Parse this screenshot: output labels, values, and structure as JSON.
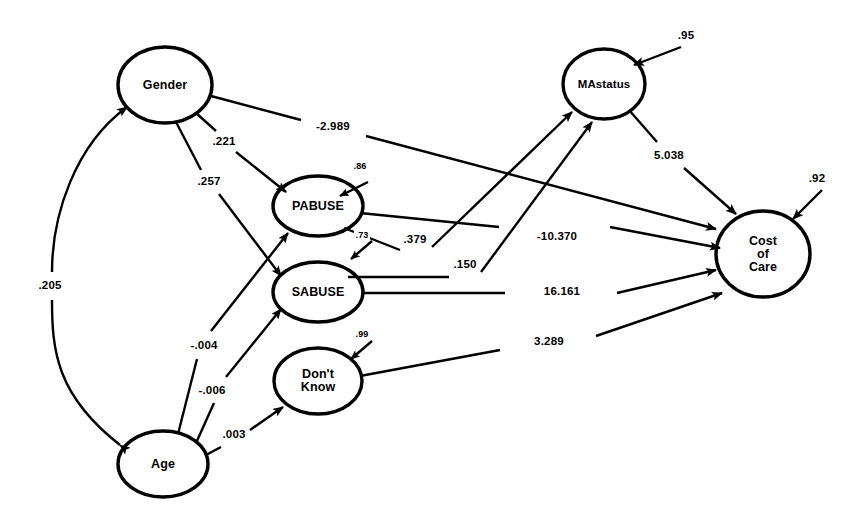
{
  "diagram": {
    "type": "path-analysis-structural-equation-model",
    "nodes": [
      {
        "id": "gender",
        "label": "Gender",
        "cx": 165,
        "cy": 85,
        "rx": 47,
        "ry": 38
      },
      {
        "id": "pabuse",
        "label": "PABUSE",
        "cx": 318,
        "cy": 206,
        "rx": 45,
        "ry": 30
      },
      {
        "id": "sabuse",
        "label": "SABUSE",
        "cx": 318,
        "cy": 292,
        "rx": 45,
        "ry": 30
      },
      {
        "id": "dontknow",
        "label": "Don't\nKnow",
        "cx": 318,
        "cy": 381,
        "rx": 44,
        "ry": 33
      },
      {
        "id": "age",
        "label": "Age",
        "cx": 163,
        "cy": 464,
        "rx": 45,
        "ry": 33
      },
      {
        "id": "mastatus",
        "label": "MAstatus",
        "cx": 604,
        "cy": 84,
        "rx": 41,
        "ry": 35
      },
      {
        "id": "cost",
        "label": "Cost\nof\nCare",
        "cx": 763,
        "cy": 254,
        "rx": 47,
        "ry": 43
      }
    ],
    "disturbances": [
      {
        "id": "e-pabuse",
        "value": ".86",
        "lx": 360,
        "ly": 166
      },
      {
        "id": "e-sabuse",
        "value": ".73",
        "lx": 362,
        "ly": 235
      },
      {
        "id": "e-dontknow",
        "value": ".99",
        "lx": 362,
        "ly": 334
      },
      {
        "id": "e-mastatus",
        "value": ".95",
        "lx": 686,
        "ly": 35
      },
      {
        "id": "e-cost",
        "value": ".92",
        "lx": 817,
        "ly": 178
      }
    ],
    "paths": [
      {
        "id": "gender-to-pabuse",
        "from": "Gender",
        "to": "PABUSE",
        "value": ".221",
        "lx": 224,
        "ly": 141
      },
      {
        "id": "gender-to-sabuse",
        "from": "Gender",
        "to": "SABUSE",
        "value": ".257",
        "lx": 209,
        "ly": 181
      },
      {
        "id": "gender-to-cost",
        "from": "Gender",
        "to": "Cost of Care",
        "value": "-2.989",
        "lx": 333,
        "ly": 126
      },
      {
        "id": "age-to-pabuse",
        "from": "Age",
        "to": "PABUSE",
        "value": "-.004",
        "lx": 204,
        "ly": 345
      },
      {
        "id": "age-to-sabuse",
        "from": "Age",
        "to": "SABUSE",
        "value": "-.006",
        "lx": 212,
        "ly": 390
      },
      {
        "id": "age-to-dontknow",
        "from": "Age",
        "to": "Don't Know",
        "value": ".003",
        "lx": 234,
        "ly": 434
      },
      {
        "id": "pabuse-to-mastatus",
        "from": "PABUSE",
        "to": "MAstatus",
        "value": ".379",
        "lx": 415,
        "ly": 239
      },
      {
        "id": "sabuse-to-mastatus",
        "from": "SABUSE",
        "to": "MAstatus",
        "value": ".150",
        "lx": 465,
        "ly": 264
      },
      {
        "id": "mastatus-to-cost",
        "from": "MAstatus",
        "to": "Cost of Care",
        "value": "5.038",
        "lx": 669,
        "ly": 155
      },
      {
        "id": "pabuse-to-cost",
        "from": "PABUSE",
        "to": "Cost of Care",
        "value": "-10.370",
        "lx": 557,
        "ly": 236
      },
      {
        "id": "sabuse-to-cost",
        "from": "SABUSE",
        "to": "Cost of Care",
        "value": "16.161",
        "lx": 562,
        "ly": 291
      },
      {
        "id": "dontknow-to-cost",
        "from": "Don't Know",
        "to": "Cost of Care",
        "value": "3.289",
        "lx": 549,
        "ly": 341
      }
    ],
    "correlations": [
      {
        "id": "gender-age-correlation",
        "between": [
          "Gender",
          "Age"
        ],
        "value": ".205",
        "lx": 50,
        "ly": 285
      }
    ],
    "style": {
      "stroke": "#000000",
      "background": "#ffffff"
    }
  }
}
